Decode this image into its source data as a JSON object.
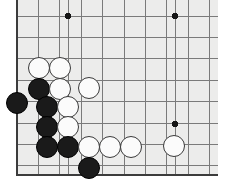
{
  "board": {
    "kind": "go-board",
    "description": "Go (Weiqi/Baduk) board position, lower-left corner region",
    "board_color": "#ececeb",
    "page_background": "#ffffff",
    "line_color": "#7a7a7a",
    "edge_line_color": "#3c3c3c",
    "black_stone_color": "#1a1a1a",
    "white_stone_color": "#fbfbfb",
    "white_stone_outline": "#3a3a3a",
    "geometry": {
      "origin_x": 17,
      "origin_y": 16,
      "spacing": 21.4,
      "cols_visible": 10,
      "rows_visible": 8,
      "left_edge_x": 17,
      "bottom_edge_y": 175,
      "top_cropped": true,
      "right_cropped": true
    },
    "star_points": [
      {
        "col": 0,
        "row": 0,
        "x": 68,
        "y": 16
      },
      {
        "col": 0,
        "row": 0,
        "x": 175,
        "y": 16
      },
      {
        "col": 0,
        "row": 0,
        "x": 175,
        "y": 124
      }
    ],
    "grid_vertical_x": [
      17,
      38.4,
      59.8,
      68,
      81.2,
      102.6,
      124,
      145.4,
      166.8,
      175,
      188.2,
      209.6
    ],
    "grid_horizontal_y": [
      16,
      37.4,
      58.8,
      80.2,
      101.6,
      123,
      144.4,
      165.8,
      175
    ],
    "stones": [
      {
        "color": "white",
        "x": 39,
        "y": 68,
        "label": "white-stone"
      },
      {
        "color": "white",
        "x": 60,
        "y": 68,
        "label": "white-stone"
      },
      {
        "color": "black",
        "x": 39,
        "y": 89,
        "label": "black-stone"
      },
      {
        "color": "white",
        "x": 60,
        "y": 89,
        "label": "white-stone"
      },
      {
        "color": "white",
        "x": 89,
        "y": 88,
        "label": "white-stone"
      },
      {
        "color": "black",
        "x": 17,
        "y": 103,
        "label": "black-stone"
      },
      {
        "color": "black",
        "x": 47,
        "y": 107,
        "label": "black-stone"
      },
      {
        "color": "white",
        "x": 68,
        "y": 107,
        "label": "white-stone"
      },
      {
        "color": "black",
        "x": 47,
        "y": 127,
        "label": "black-stone"
      },
      {
        "color": "white",
        "x": 68,
        "y": 127,
        "label": "white-stone"
      },
      {
        "color": "black",
        "x": 47,
        "y": 147,
        "label": "black-stone"
      },
      {
        "color": "black",
        "x": 68,
        "y": 147,
        "label": "black-stone"
      },
      {
        "color": "white",
        "x": 89,
        "y": 147,
        "label": "white-stone"
      },
      {
        "color": "white",
        "x": 110,
        "y": 147,
        "label": "white-stone"
      },
      {
        "color": "white",
        "x": 131,
        "y": 147,
        "label": "white-stone"
      },
      {
        "color": "white",
        "x": 174,
        "y": 146,
        "label": "white-stone"
      },
      {
        "color": "black",
        "x": 89,
        "y": 168,
        "label": "black-stone"
      }
    ],
    "stone_radius": 11,
    "counts": {
      "black": 7,
      "white": 10,
      "total": 17
    }
  }
}
